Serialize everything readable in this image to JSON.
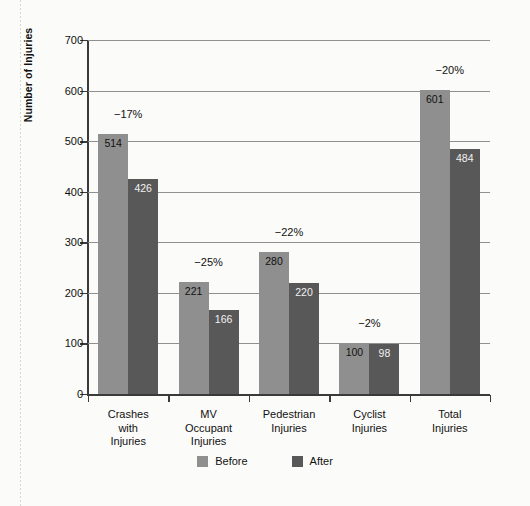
{
  "chart_data": {
    "type": "bar",
    "title": "",
    "xlabel": "",
    "ylabel": "Number of Injuries",
    "ylim": [
      0,
      700
    ],
    "yticks": [
      0,
      100,
      200,
      300,
      400,
      500,
      600,
      700
    ],
    "ytick_labels": [
      "0",
      "100",
      "200",
      "300",
      "400",
      "500",
      "600",
      "700"
    ],
    "grid": true,
    "legend_position": "bottom-center",
    "categories": [
      "Crashes\nwith\nInjuries",
      "MV\nOccupant\nInjuries",
      "Pedestrian\nInjuries",
      "Cyclist\nInjuries",
      "Total\nInjuries"
    ],
    "series": [
      {
        "name": "Before",
        "color": "#8f8f8f",
        "values": [
          514,
          221,
          280,
          100,
          601
        ]
      },
      {
        "name": "After",
        "color": "#585858",
        "values": [
          426,
          166,
          220,
          98,
          484
        ]
      }
    ],
    "annotations": [
      {
        "category": "Crashes with Injuries",
        "text": "−17%",
        "value": -17
      },
      {
        "category": "MV Occupant Injuries",
        "text": "−25%",
        "value": -25
      },
      {
        "category": "Pedestrian Injuries",
        "text": "−22%",
        "value": -22
      },
      {
        "category": "Cyclist Injuries",
        "text": "−2%",
        "value": -2
      },
      {
        "category": "Total Injuries",
        "text": "−20%",
        "value": -20
      }
    ]
  },
  "axis": {
    "y_title": "Number of Injuries",
    "ticks": [
      {
        "label": "700",
        "value": 700
      },
      {
        "label": "600",
        "value": 600
      },
      {
        "label": "500",
        "value": 500
      },
      {
        "label": "400",
        "value": 400
      },
      {
        "label": "300",
        "value": 300
      },
      {
        "label": "200",
        "value": 200
      },
      {
        "label": "100",
        "value": 100
      },
      {
        "label": "0",
        "value": 0
      }
    ]
  },
  "groups": [
    {
      "label_lines": [
        "Crashes",
        "with",
        "Injuries"
      ],
      "pct": "−17%",
      "before": {
        "label": "514",
        "value": 514
      },
      "after": {
        "label": "426",
        "value": 426
      }
    },
    {
      "label_lines": [
        "MV",
        "Occupant",
        "Injuries"
      ],
      "pct": "−25%",
      "before": {
        "label": "221",
        "value": 221
      },
      "after": {
        "label": "166",
        "value": 166
      }
    },
    {
      "label_lines": [
        "Pedestrian",
        "Injuries"
      ],
      "pct": "−22%",
      "before": {
        "label": "280",
        "value": 280
      },
      "after": {
        "label": "220",
        "value": 220
      }
    },
    {
      "label_lines": [
        "Cyclist",
        "Injuries"
      ],
      "pct": "−2%",
      "before": {
        "label": "100",
        "value": 100
      },
      "after": {
        "label": "98",
        "value": 98
      }
    },
    {
      "label_lines": [
        "Total",
        "Injuries"
      ],
      "pct": "−20%",
      "before": {
        "label": "601",
        "value": 601
      },
      "after": {
        "label": "484",
        "value": 484
      }
    }
  ],
  "legend": {
    "items": [
      {
        "label": "Before",
        "color": "#8f8f8f"
      },
      {
        "label": "After",
        "color": "#585858"
      }
    ]
  },
  "colors": {
    "before": "#8f8f8f",
    "after": "#585858",
    "grid": "#8f8f8f",
    "axis": "#3a3a3a",
    "background": "#fbfbf9",
    "text": "#111111"
  }
}
